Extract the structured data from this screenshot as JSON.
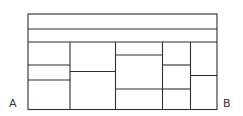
{
  "diagram": {
    "stroke_color": "#2e2e2e",
    "stroke_width": 1.1,
    "background": "#ffffff",
    "outer_box": {
      "x": 28,
      "y": 14,
      "w": 189,
      "h": 95.5
    },
    "top_strips": [
      {
        "y": 29
      },
      {
        "y": 42
      }
    ],
    "columns": [
      {
        "x0": 28,
        "x1": 70,
        "dividers_y": [
          65,
          80
        ]
      },
      {
        "x0": 70,
        "x1": 115.5,
        "dividers_y": [
          71.5
        ]
      },
      {
        "x0": 115.5,
        "x1": 162.5,
        "dividers_y": [
          55,
          89
        ]
      },
      {
        "x0": 162.5,
        "x1": 190.5,
        "dividers_y": [
          65,
          89
        ]
      },
      {
        "x0": 190.5,
        "x1": 217,
        "dividers_y": [
          75.5
        ]
      }
    ],
    "grid_top": 42,
    "grid_bottom": 109.5
  },
  "labels": {
    "left": {
      "text": "A",
      "x": 9,
      "y": 98
    },
    "right": {
      "text": "B",
      "x": 223,
      "y": 98
    }
  }
}
